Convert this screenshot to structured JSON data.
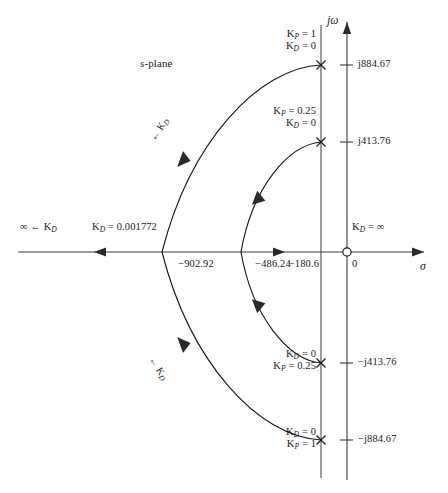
{
  "figure": {
    "domain_label": "s-plane",
    "plane_label_parts": {
      "italic": "s",
      "rest": "-plane"
    },
    "axes": {
      "real_axis_name": "σ",
      "imag_axis_name": "jω",
      "origin_label": "0"
    },
    "real_axis_ticks": [
      {
        "id": "r1",
        "label": "−902.92",
        "value": -902.92,
        "x": 162
      },
      {
        "id": "r2",
        "label": "−486.24",
        "value": -486.24,
        "x": 241
      },
      {
        "id": "r3",
        "label": "−180.6",
        "value": -180.6,
        "x": 321
      },
      {
        "id": "r4",
        "label": "0",
        "value": 0,
        "x": 347
      }
    ],
    "imag_axis_ticks": [
      {
        "id": "i1",
        "label": "j884.67",
        "value": 884.67,
        "y": 65
      },
      {
        "id": "i2",
        "label": "j413.76",
        "value": 413.76,
        "y": 142
      },
      {
        "id": "i3",
        "label": "−j413.76",
        "value": -413.76,
        "y": 363
      },
      {
        "id": "i4",
        "label": "−j884.67",
        "value": -884.67,
        "y": 440
      }
    ],
    "pole_markers": [
      {
        "id": "p1",
        "glyph": "×",
        "x": 321,
        "y": 65,
        "note": "upper outer pole at j884.67"
      },
      {
        "id": "p2",
        "glyph": "×",
        "x": 321,
        "y": 142,
        "note": "upper inner pole at j413.76"
      },
      {
        "id": "p3",
        "glyph": "×",
        "x": 321,
        "y": 363,
        "note": "lower inner pole at -j413.76"
      },
      {
        "id": "p4",
        "glyph": "×",
        "x": 321,
        "y": 440,
        "note": "lower outer pole at -j884.67"
      }
    ],
    "zero_marker": {
      "id": "z1",
      "glyph": "○",
      "x": 347,
      "y": 252,
      "label": "open-circle zero at origin"
    },
    "annotations": [
      {
        "id": "a1",
        "lines": [
          "K_P = 1",
          "K_D = 0"
        ],
        "line1_main": "K",
        "line1_sub": "P",
        "line1_rest": " = 1",
        "line2_main": "K",
        "line2_sub": "D",
        "line2_rest": " = 0",
        "x": 316,
        "y": 34,
        "align": "right"
      },
      {
        "id": "a2",
        "lines": [
          "K_P = 0.25",
          "K_D = 0"
        ],
        "line1_main": "K",
        "line1_sub": "P",
        "line1_rest": " = 0.25",
        "line2_main": "K",
        "line2_sub": "D",
        "line2_rest": " = 0",
        "x": 316,
        "y": 111,
        "align": "right"
      },
      {
        "id": "a3",
        "lines": [
          "K_D = 0",
          "K_P = 0.25"
        ],
        "line1_main": "K",
        "line1_sub": "D",
        "line1_rest": " = 0",
        "line2_main": "K",
        "line2_sub": "P",
        "line2_rest": " = 0.25",
        "x": 316,
        "y": 353,
        "align": "right"
      },
      {
        "id": "a4",
        "lines": [
          "K_D = 0",
          "K_P = 1"
        ],
        "line1_main": "K",
        "line1_sub": "D",
        "line1_rest": " = 0",
        "line2_main": "K",
        "line2_sub": "P",
        "line2_rest": " = 1",
        "x": 316,
        "y": 430,
        "align": "right"
      }
    ],
    "axis_annotations": [
      {
        "id": "ax1",
        "main": "∞ ← K",
        "sub": "D",
        "rest": "",
        "x": 28,
        "y": 228,
        "text": "∞ ← K_D"
      },
      {
        "id": "ax2",
        "main": "K",
        "sub": "D",
        "rest": " = 0.001772",
        "x": 92,
        "y": 228,
        "text": "K_D = 0.001772"
      },
      {
        "id": "ax3",
        "main": "K",
        "sub": "D",
        "rest": " = ∞",
        "x": 352,
        "y": 228,
        "text": "K_D = ∞"
      }
    ],
    "branch_labels": [
      {
        "id": "b1",
        "main": "← K",
        "sub": "D",
        "x": 166,
        "y": 140,
        "rotate": -57,
        "text": "← K_D"
      },
      {
        "id": "b2",
        "main": "← K",
        "sub": "D",
        "x": 166,
        "y": 352,
        "rotate": 57,
        "text": "← K_D"
      }
    ],
    "colors": {
      "stroke": "#1a1a1a",
      "axis": "#3a3a3a",
      "background": "#ffffff"
    },
    "geometry": {
      "origin": {
        "x": 347,
        "y": 252
      },
      "outer_arc": {
        "real_crossing_x": 162,
        "endpoint_x": 321,
        "endpoint_y_upper": 65,
        "endpoint_y_lower": 440
      },
      "inner_arc": {
        "real_crossing_x": 241,
        "endpoint_x": 321,
        "endpoint_y_upper": 142,
        "endpoint_y_lower": 363
      },
      "vertical_asymptote_x": 321
    }
  }
}
